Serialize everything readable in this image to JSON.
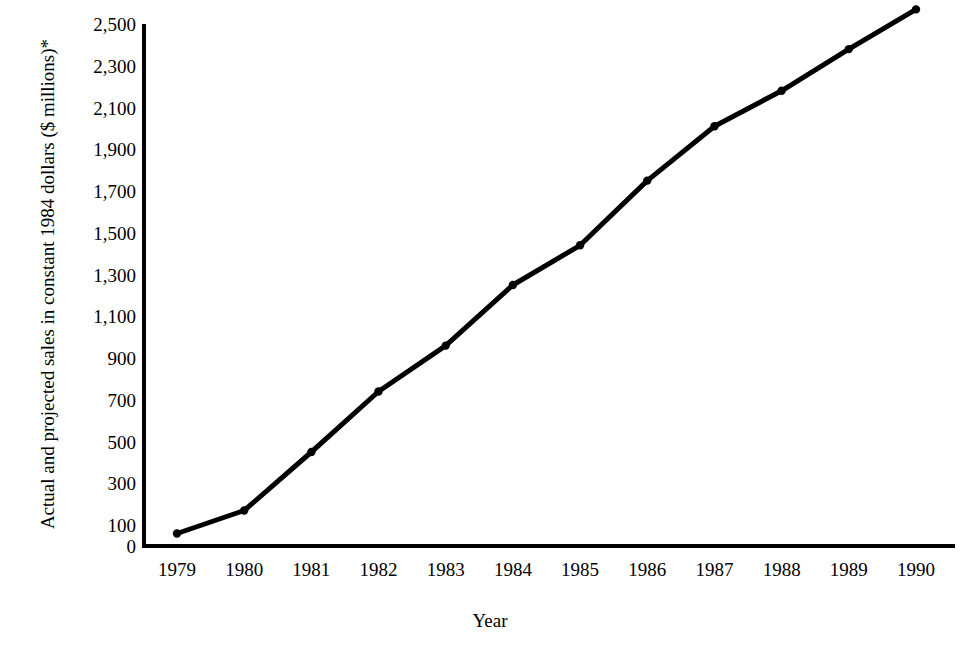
{
  "chart_data": {
    "type": "line",
    "title": "",
    "clipped_top_title": "",
    "xlabel": "Year",
    "ylabel": "Actual and projected sales in constant 1984 dollars ($ millions)*",
    "categories": [
      1979,
      1980,
      1981,
      1982,
      1983,
      1984,
      1985,
      1986,
      1987,
      1988,
      1989,
      1990
    ],
    "x_tick_labels": [
      "1979",
      "1980",
      "1981",
      "1982",
      "1983",
      "1984",
      "1985",
      "1986",
      "1987",
      "1988",
      "1989",
      "1990"
    ],
    "values": [
      60,
      170,
      450,
      740,
      960,
      1250,
      1440,
      1750,
      2010,
      2180,
      2380,
      2570
    ],
    "y_tick_values": [
      0,
      100,
      300,
      500,
      700,
      900,
      1100,
      1300,
      1500,
      1700,
      1900,
      2100,
      2300,
      2500
    ],
    "y_tick_labels": [
      "0",
      "100",
      "300",
      "500",
      "700",
      "900",
      "1,100",
      "1,300",
      "1,500",
      "1,700",
      "1,900",
      "2,100",
      "2,300",
      "2,500"
    ],
    "ylim": [
      0,
      2500
    ],
    "xlim": [
      1979,
      1990
    ],
    "grid": false,
    "legend": false,
    "legend_position": "none",
    "series": [
      {
        "name": "Actual and projected sales",
        "values": [
          60,
          170,
          450,
          740,
          960,
          1250,
          1440,
          1750,
          2010,
          2180,
          2380,
          2570
        ],
        "color": "#000000",
        "marker": "circle",
        "line_width": 5
      }
    ],
    "annotations": []
  },
  "colors": {
    "line": "#000000",
    "axis": "#000000",
    "background": "#ffffff",
    "text": "#000000",
    "clipped_title": "#b9b9bf"
  }
}
